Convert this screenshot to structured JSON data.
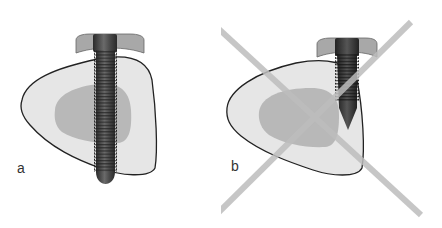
{
  "figure": {
    "panels": [
      {
        "label": "a",
        "description": "Correct screw placement: screw passes fully through the bone cross-section, perpendicular, with tip protruding beyond far cortex",
        "status": "correct"
      },
      {
        "label": "b",
        "description": "Incorrect screw placement: short screw placed at the edge of the bone, not engaging far cortex; crossed out",
        "status": "incorrect"
      }
    ],
    "colors": {
      "bone_outer": "#e6e6e6",
      "bone_inner": "#b8b8b8",
      "bone_outline": "#222222",
      "screw_dark": "#3a3a3a",
      "screw_head": "#8a8a8a",
      "washer": "#b0b0b0",
      "cross_mark": "#bdbdbd"
    }
  }
}
